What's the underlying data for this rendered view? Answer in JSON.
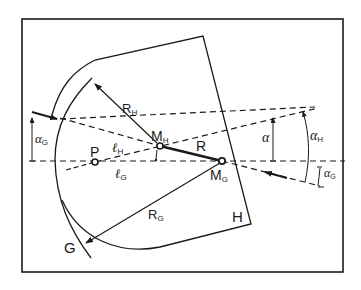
{
  "diagram": {
    "type": "geometric construction",
    "frame": {
      "x": 22,
      "y": 19,
      "width": 321,
      "height": 253
    },
    "colors": {
      "line": "#1a1a1a",
      "background": "#ffffff"
    },
    "labels": {
      "R_H_main": "R",
      "R_H_sub": "H",
      "M_H_main": "M",
      "M_H_sub": "H",
      "M_G_main": "M",
      "M_G_sub": "G",
      "R": "R",
      "P": "P",
      "l_H_main": "ℓ",
      "l_H_sub": "H",
      "l_G_main": "ℓ",
      "l_G_sub": "G",
      "R_G_main": "R",
      "R_G_sub": "G",
      "G": "G",
      "H": "H",
      "alpha": "α",
      "alpha_H_main": "α",
      "alpha_H_sub": "H",
      "alpha_G_left_main": "α",
      "alpha_G_left_sub": "G",
      "alpha_G_right_main": "α",
      "alpha_G_right_sub": "G"
    },
    "points": {
      "P": [
        95,
        162
      ],
      "M_H": [
        160,
        146
      ],
      "M_G": [
        222,
        161
      ],
      "H_top_vertex": [
        203,
        36
      ],
      "H_bottom_vertex": [
        251,
        224
      ]
    }
  }
}
